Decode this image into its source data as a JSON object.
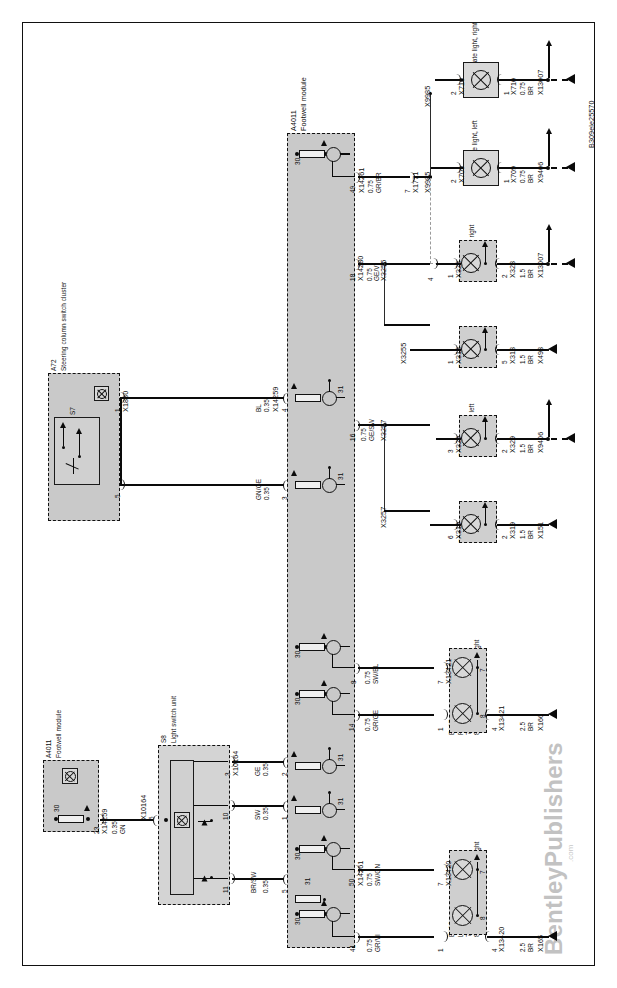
{
  "document": {
    "reference_code": "B309ele25570",
    "publisher": "BentleyPublishers",
    "publisher_suffix": ".com",
    "type": "Automotive wiring diagram",
    "orientation": "rotated-90-ccw"
  },
  "modules": {
    "footwell_main": {
      "id": "A4011",
      "name": "Footwell module",
      "terminals_power": [
        "30",
        "30",
        "30",
        "30",
        "30",
        "30"
      ],
      "terminals_ground": [
        "31",
        "31",
        "31",
        "31",
        "31",
        "31"
      ],
      "pins": [
        {
          "pin": "49",
          "connector": "X14261",
          "gauge": "0.75",
          "color": "GR/BR"
        },
        {
          "pin": "18",
          "connector": "X14280",
          "gauge": "0.75",
          "color": "GE/VI"
        },
        {
          "pin": "16",
          "connector": "",
          "gauge": "0.75",
          "color": "GE/SW"
        },
        {
          "pin": "4",
          "connector": "X14259",
          "gauge": "0.35",
          "color": "BL"
        },
        {
          "pin": "3",
          "connector": "",
          "gauge": "0.35",
          "color": "GN/GE"
        },
        {
          "pin": "8",
          "connector": "",
          "gauge": "0.75",
          "color": "SW/BL"
        },
        {
          "pin": "14",
          "connector": "",
          "gauge": "0.75",
          "color": "GR/GE"
        },
        {
          "pin": "2",
          "connector": "",
          "gauge": "0.35",
          "color": "GE"
        },
        {
          "pin": "1",
          "connector": "",
          "gauge": "0.35",
          "color": "SW"
        },
        {
          "pin": "5",
          "connector": "",
          "gauge": "0.35",
          "color": "BR/SW"
        },
        {
          "pin": "50",
          "connector": "X14261",
          "gauge": "0.75",
          "color": "SW/GN"
        },
        {
          "pin": "41",
          "connector": "",
          "gauge": "0.75",
          "color": "GR/VI"
        }
      ]
    },
    "footwell_small": {
      "id": "A4011",
      "name": "Footwell module",
      "terminal_power": "30",
      "pin": "23",
      "connector": "X14259",
      "gauge": "0.35",
      "color": "GN",
      "out_pin": "5",
      "out_connector": "X10164"
    },
    "steering_column": {
      "id": "A72",
      "name": "Steering column switch cluster",
      "switch_id": "S7",
      "pins": [
        {
          "pin": "1",
          "connector": "X1880"
        },
        {
          "pin": "5",
          "connector": ""
        }
      ]
    },
    "light_switch": {
      "id": "S8",
      "name": "Light switch unit",
      "supply_pin": "5",
      "supply_connector": "X10164",
      "connector": "X10164",
      "pins": [
        "3",
        "10",
        "11"
      ]
    }
  },
  "lamps": [
    {
      "id": "E44a",
      "name": "License plate light, right",
      "in_pin": "2",
      "in_connector": "X710",
      "out_pin": "1",
      "out_connector": "X710",
      "gauge": "0.75",
      "color": "BR",
      "ground": "X13007"
    },
    {
      "id": "E43a",
      "name": "License plate light, left",
      "in_pin": "2",
      "in_connector": "X709",
      "out_pin": "1",
      "out_connector": "X709",
      "gauge": "0.75",
      "color": "BR",
      "ground": "X9406"
    },
    {
      "id": "E81",
      "name": "Tail light, inner right",
      "in_pin": "1",
      "in_connector": "X328",
      "out_pin": "2",
      "out_connector": "X328",
      "gauge": "1.5",
      "color": "BR",
      "ground": "X13007"
    },
    {
      "id": "E47a",
      "name": "Taillight, right",
      "in_pin": "1",
      "in_connector": "X318",
      "out_pin": "5",
      "out_connector": "X318",
      "gauge": "1.5",
      "color": "BR",
      "ground": "X498"
    },
    {
      "id": "E80",
      "name": "Tail light, inner left",
      "in_pin": "3",
      "in_connector": "X329",
      "out_pin": "2",
      "out_connector": "X329",
      "gauge": "1.5",
      "color": "BR",
      "ground": "X9406"
    },
    {
      "id": "E46a",
      "name": "Taillight, left",
      "in_pin": "6",
      "in_connector": "X319",
      "out_pin": "2",
      "out_connector": "X319",
      "gauge": "1.5",
      "color": "BR",
      "ground": "X151"
    }
  ],
  "headlights": [
    {
      "id": "E127",
      "name": "Right headlight",
      "note_7": "7) Side marker light",
      "note_8": "8) Side light/daytime driving light",
      "lamp_a": "7",
      "lamp_b": "8",
      "in_pin_a": "7",
      "in_connector_a": "X13421",
      "in_pin_b": "1",
      "out_pin": "4",
      "out_connector": "X13421",
      "gauge": "2.5",
      "color": "BR",
      "ground": "X166"
    },
    {
      "id": "E126",
      "name": "Left headlight",
      "note_7": "7) Side marker light",
      "note_8": "8) Side light/daytime driving light",
      "lamp_a": "7",
      "lamp_b": "8",
      "in_pin_a": "7",
      "in_connector_a": "X13420",
      "in_pin_b": "1",
      "out_pin": "4",
      "out_connector": "X13420",
      "gauge": "2.5",
      "color": "BR",
      "ground": "X165"
    }
  ],
  "splices": {
    "x9985_upper": "X9985",
    "x9985_lower": "X9985",
    "x1771": "X1771",
    "x1771_pin": "7",
    "x3255": "X3255",
    "x3255_pin": "4",
    "x3257_upper": "X3257",
    "x3257_lower": "X3257"
  }
}
